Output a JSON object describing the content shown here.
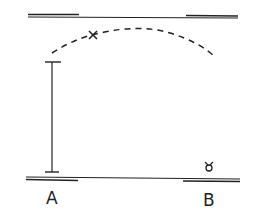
{
  "diagram": {
    "labels": {
      "a": "A",
      "b": "B"
    },
    "markers": {
      "cross": "×",
      "small_symbol": "ꝺ"
    },
    "colors": {
      "ink": "#222222",
      "background": "#ffffff"
    }
  }
}
